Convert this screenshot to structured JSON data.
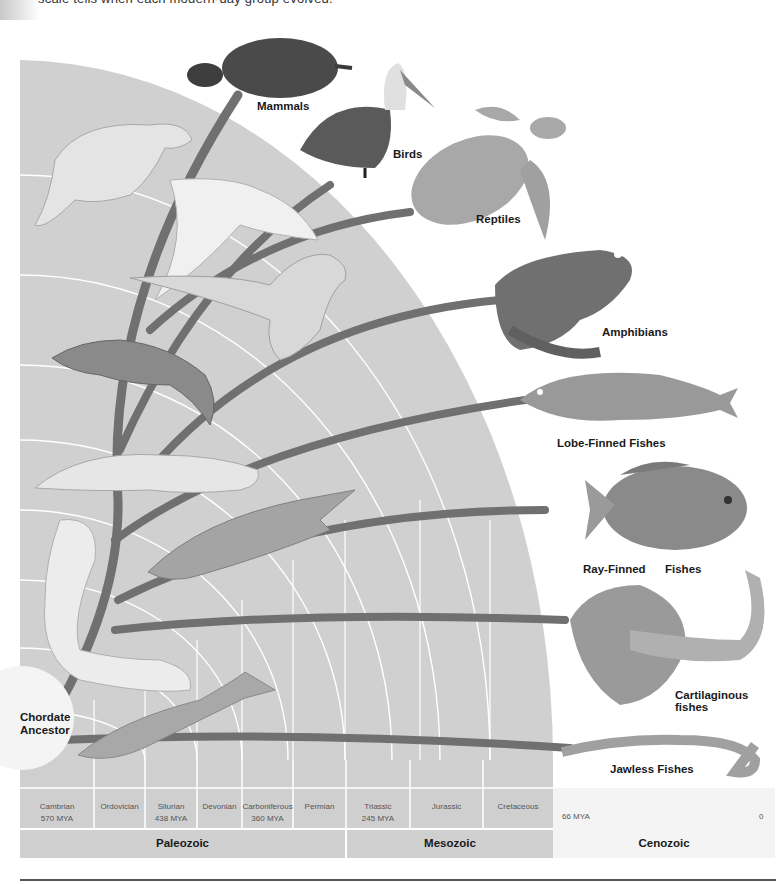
{
  "caption": "scale tells when each modern-day group evolved.",
  "ancestor": {
    "line1": "Chordate",
    "line2": "Ancestor"
  },
  "groups": {
    "mammals": "Mammals",
    "birds": "Birds",
    "reptiles": "Reptiles",
    "amphibians": "Amphibians",
    "lobe_finned": "Lobe-Finned Fishes",
    "ray_finned_1": "Ray-Finned",
    "ray_finned_2": "Fishes",
    "cartilaginous_1": "Cartilaginous",
    "cartilaginous_2": "fishes",
    "jawless": "Jawless Fishes"
  },
  "periods": [
    {
      "name": "Cambrian",
      "mya": "570 MYA"
    },
    {
      "name": "Ordovician",
      "mya": ""
    },
    {
      "name": "Silurian",
      "mya": "438 MYA"
    },
    {
      "name": "Devonian",
      "mya": ""
    },
    {
      "name": "Carboniferous",
      "mya": "360 MYA"
    },
    {
      "name": "Permian",
      "mya": ""
    },
    {
      "name": "Triassic",
      "mya": "245 MYA"
    },
    {
      "name": "Jurassic",
      "mya": ""
    },
    {
      "name": "Cretaceous",
      "mya": ""
    }
  ],
  "cenozoic_start": "66 MYA",
  "present": "0",
  "eras": {
    "paleozoic": "Paleozoic",
    "mesozoic": "Mesozoic",
    "cenozoic": "Cenozoic"
  },
  "colors": {
    "band": "#c9c9c9",
    "band_light": "#d6d6d6",
    "branch": "#6e6e6e",
    "grid_line": "#ffffff"
  }
}
